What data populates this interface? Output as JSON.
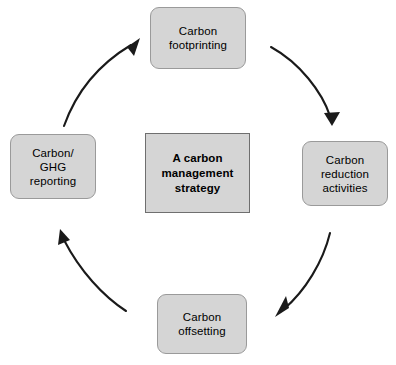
{
  "diagram": {
    "background_color": "#ffffff",
    "node_fill_color": "#d5d5d5",
    "node_border_color": "#9a9a9a",
    "center_border_color": "#6f6f6f",
    "arrow_color": "#1a1a1a",
    "center": {
      "label": "A carbon\nmanagement\nstrategy"
    },
    "nodes": [
      {
        "id": "footprinting",
        "label": "Carbon\nfootprinting",
        "position": "top"
      },
      {
        "id": "reduction",
        "label": "Carbon\nreduction\nactivities",
        "position": "right"
      },
      {
        "id": "offsetting",
        "label": "Carbon\noffsetting",
        "position": "bottom"
      },
      {
        "id": "reporting",
        "label": "Carbon/\nGHG\nreporting",
        "position": "left"
      }
    ],
    "arrows": [
      {
        "id": "arrow-footprinting-to-reduction",
        "from": "footprinting",
        "to": "reduction",
        "direction": "clockwise"
      },
      {
        "id": "arrow-reduction-to-offsetting",
        "from": "reduction",
        "to": "offsetting",
        "direction": "clockwise"
      },
      {
        "id": "arrow-offsetting-to-reporting",
        "from": "offsetting",
        "to": "reporting",
        "direction": "clockwise"
      },
      {
        "id": "arrow-reporting-to-footprinting",
        "from": "reporting",
        "to": "footprinting",
        "direction": "clockwise"
      }
    ]
  }
}
